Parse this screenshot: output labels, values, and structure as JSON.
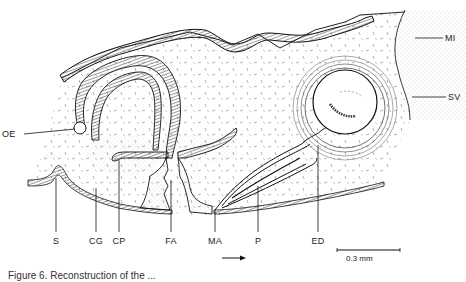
{
  "figure": {
    "caption": "Figure 6. Reconstruction of the ...",
    "scale_bar": {
      "label": "0.3 mm"
    },
    "direction_arrow": "right-arrow",
    "labels": {
      "OE": "OE",
      "S": "S",
      "CG": "CG",
      "CP": "CP",
      "FA": "FA",
      "MA": "MA",
      "P": "P",
      "ED": "ED",
      "MI": "MI",
      "SV": "SV"
    },
    "colors": {
      "ink": "#1a1a1a",
      "background": "#ffffff",
      "stipple": "#555555"
    }
  }
}
